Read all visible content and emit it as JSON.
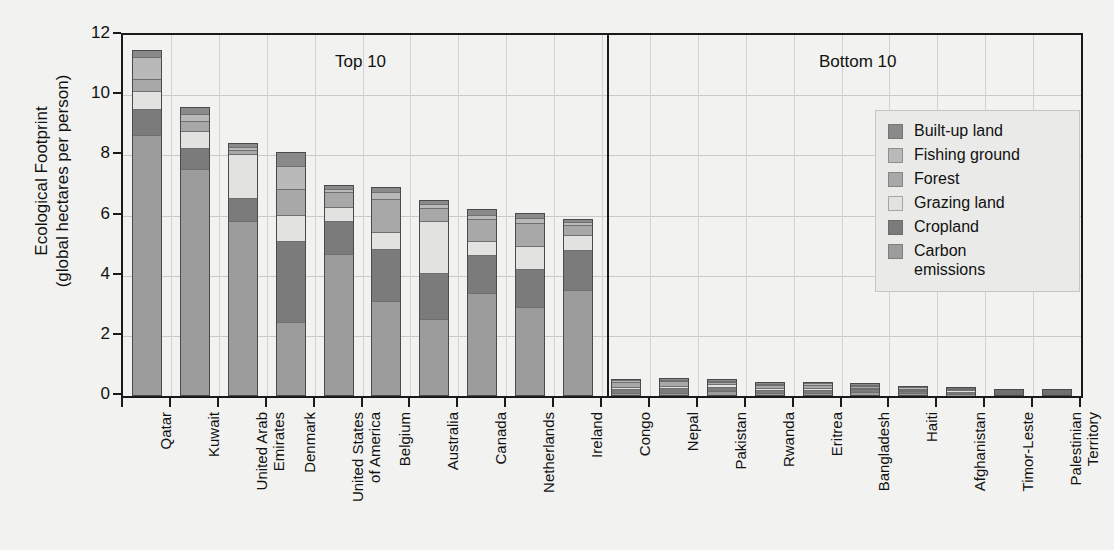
{
  "axis": {
    "y_title": "Ecological Footprint\n(global hectares per person)",
    "y_ticks": [
      "0",
      "2",
      "4",
      "6",
      "8",
      "10",
      "12"
    ]
  },
  "sections": {
    "top_label": "Top 10",
    "bottom_label": "Bottom 10"
  },
  "legend": {
    "items": [
      {
        "label": "Built-up land",
        "color": "#8a8a8a"
      },
      {
        "label": "Fishing ground",
        "color": "#b9b9b9"
      },
      {
        "label": "Forest",
        "color": "#a8a8a8"
      },
      {
        "label": "Grazing land",
        "color": "#e2e2e0"
      },
      {
        "label": "Cropland",
        "color": "#7b7b7b"
      },
      {
        "label": "Carbon\nemissions",
        "color": "#9c9c9c"
      }
    ]
  },
  "chart_data": {
    "type": "bar",
    "subtype": "stacked-bar",
    "title": "",
    "xlabel": "",
    "ylabel": "Ecological Footprint (global hectares per person)",
    "ylim": [
      0,
      12
    ],
    "yticks": [
      0,
      2,
      4,
      6,
      8,
      10,
      12
    ],
    "grid": true,
    "legend_position": "inside-right",
    "groups": [
      "Top 10",
      "Bottom 10"
    ],
    "categories": [
      "Qatar",
      "Kuwait",
      "United Arab\nEmirates",
      "Denmark",
      "United States\nof America",
      "Belgium",
      "Australia",
      "Canada",
      "Netherlands",
      "Ireland",
      "Congo",
      "Nepal",
      "Pakistan",
      "Rwanda",
      "Eritrea",
      "Bangladesh",
      "Haiti",
      "Afghanistan",
      "Timor-Leste",
      "Palestinian\nTerritory"
    ],
    "series": [
      {
        "name": "Carbon emissions",
        "color": "#9c9c9c",
        "values": [
          8.8,
          7.65,
          5.9,
          2.45,
          4.8,
          3.2,
          2.6,
          3.5,
          3.0,
          3.6,
          0.07,
          0.06,
          0.18,
          0.04,
          0.06,
          0.15,
          0.06,
          0.07,
          0.05,
          0.12
        ]
      },
      {
        "name": "Cropland",
        "color": "#7b7b7b",
        "values": [
          0.85,
          0.7,
          0.75,
          2.75,
          1.1,
          1.75,
          1.55,
          1.25,
          1.3,
          1.35,
          0.18,
          0.22,
          0.18,
          0.2,
          0.15,
          0.13,
          0.14,
          0.13,
          0.08,
          0.04
        ]
      },
      {
        "name": "Grazing land",
        "color": "#e2e2e0",
        "values": [
          0.55,
          0.55,
          1.5,
          0.85,
          0.45,
          0.55,
          1.75,
          0.45,
          0.75,
          0.5,
          0.05,
          0.05,
          0.08,
          0.03,
          0.07,
          0.03,
          0.03,
          0.04,
          0.02,
          0.02
        ]
      },
      {
        "name": "Forest",
        "color": "#a8a8a8",
        "values": [
          0.4,
          0.3,
          0.1,
          0.85,
          0.5,
          1.1,
          0.4,
          0.75,
          0.75,
          0.3,
          0.22,
          0.2,
          0.06,
          0.13,
          0.13,
          0.05,
          0.05,
          0.03,
          0.04,
          0.02
        ]
      },
      {
        "name": "Fishing ground",
        "color": "#b9b9b9",
        "values": [
          0.7,
          0.2,
          0.05,
          0.75,
          0.05,
          0.2,
          0.1,
          0.1,
          0.15,
          0.05,
          0.02,
          0.02,
          0.02,
          0.01,
          0.03,
          0.02,
          0.02,
          0.01,
          0.01,
          0.01
        ]
      },
      {
        "name": "Built-up land",
        "color": "#8a8a8a",
        "values": [
          0.2,
          0.2,
          0.1,
          0.45,
          0.1,
          0.15,
          0.1,
          0.15,
          0.15,
          0.1,
          0.04,
          0.05,
          0.03,
          0.04,
          0.03,
          0.04,
          0.03,
          0.02,
          0.02,
          0.01
        ]
      }
    ],
    "totals": [
      11.5,
      9.6,
      8.4,
      8.1,
      7.0,
      6.95,
      6.5,
      6.2,
      6.1,
      5.9,
      0.58,
      0.6,
      0.55,
      0.45,
      0.47,
      0.42,
      0.33,
      0.3,
      0.22,
      0.22
    ]
  }
}
